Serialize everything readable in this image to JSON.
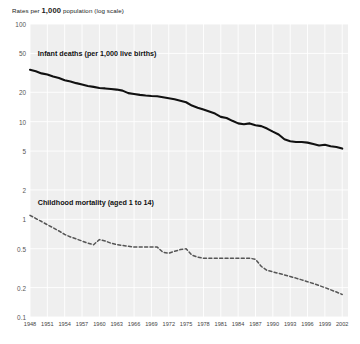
{
  "chart_data": {
    "type": "line",
    "title": "Rates per 1,000 population (log scale)",
    "title_plain": "Rates per 1,000 population (log scale)",
    "title_prefix": "Rates per ",
    "title_bold": "1,000",
    "title_suffix": " population (log scale)",
    "xlabel": "",
    "ylabel": "Rates per 1,000 population (log scale)",
    "yscale": "log",
    "ylim": [
      0.1,
      100
    ],
    "xlim": [
      1948,
      2003
    ],
    "grid": true,
    "legend_position": "inline-annotations",
    "ytick_labels": [
      "100",
      "50",
      "20",
      "10",
      "5",
      "2",
      "1",
      "0.5",
      "0.2",
      "0.1"
    ],
    "ytick_values": [
      100,
      50,
      20,
      10,
      5,
      2,
      1,
      0.5,
      0.2,
      0.1
    ],
    "xtick_labels": [
      "1948",
      "1951",
      "1954",
      "1957",
      "1960",
      "1963",
      "1966",
      "1969",
      "1972",
      "1975",
      "1978",
      "1981",
      "1984",
      "1987",
      "1990",
      "1993",
      "1996",
      "1999",
      "2002"
    ],
    "xtick_values": [
      1948,
      1951,
      1954,
      1957,
      1960,
      1963,
      1966,
      1969,
      1972,
      1975,
      1978,
      1981,
      1984,
      1987,
      1990,
      1993,
      1996,
      1999,
      2002
    ],
    "annotations": [
      {
        "name": "infant-deaths-label",
        "text": "Infant deaths (per 1,000 live births)",
        "x": 1949,
        "y": 50
      },
      {
        "name": "childhood-mortality-label",
        "text": "Childhood mortality (aged 1 to 14)",
        "x": 1949,
        "y": 1.5
      }
    ],
    "series": [
      {
        "name": "Infant deaths (per 1,000 live births)",
        "style": "solid",
        "color": "#111111",
        "x": [
          1948,
          1949,
          1950,
          1951,
          1952,
          1953,
          1954,
          1955,
          1956,
          1957,
          1958,
          1959,
          1960,
          1961,
          1962,
          1963,
          1964,
          1965,
          1966,
          1967,
          1968,
          1969,
          1970,
          1971,
          1972,
          1973,
          1974,
          1975,
          1976,
          1977,
          1978,
          1979,
          1980,
          1981,
          1982,
          1983,
          1984,
          1985,
          1986,
          1987,
          1988,
          1989,
          1990,
          1991,
          1992,
          1993,
          1994,
          1995,
          1996,
          1997,
          1998,
          1999,
          2000,
          2001,
          2002
        ],
        "values": [
          34.0,
          32.8,
          31.2,
          30.4,
          29.0,
          28.0,
          26.6,
          25.8,
          24.8,
          24.0,
          23.2,
          22.7,
          22.1,
          21.9,
          21.6,
          21.3,
          20.8,
          19.6,
          19.2,
          18.8,
          18.5,
          18.3,
          18.2,
          17.8,
          17.4,
          17.0,
          16.4,
          15.8,
          14.6,
          13.9,
          13.3,
          12.7,
          12.1,
          11.2,
          10.9,
          10.2,
          9.6,
          9.4,
          9.6,
          9.2,
          9.0,
          8.5,
          7.9,
          7.4,
          6.6,
          6.3,
          6.2,
          6.2,
          6.1,
          5.9,
          5.7,
          5.8,
          5.6,
          5.5,
          5.3
        ]
      },
      {
        "name": "Childhood mortality (aged 1 to 14)",
        "style": "dashed",
        "color": "#555555",
        "x": [
          1948,
          1949,
          1950,
          1951,
          1952,
          1953,
          1954,
          1955,
          1956,
          1957,
          1958,
          1959,
          1960,
          1961,
          1962,
          1963,
          1964,
          1965,
          1966,
          1967,
          1968,
          1969,
          1970,
          1971,
          1972,
          1973,
          1974,
          1975,
          1976,
          1977,
          1978,
          1979,
          1980,
          1981,
          1982,
          1983,
          1984,
          1985,
          1986,
          1987,
          1988,
          1989,
          1990,
          1991,
          1992,
          1993,
          1994,
          1995,
          1996,
          1997,
          1998,
          1999,
          2000,
          2001,
          2002
        ],
        "values": [
          1.1,
          1.02,
          0.95,
          0.88,
          0.82,
          0.76,
          0.7,
          0.66,
          0.63,
          0.6,
          0.57,
          0.55,
          0.62,
          0.6,
          0.57,
          0.55,
          0.54,
          0.53,
          0.52,
          0.52,
          0.52,
          0.52,
          0.52,
          0.46,
          0.45,
          0.47,
          0.49,
          0.5,
          0.43,
          0.41,
          0.4,
          0.4,
          0.4,
          0.4,
          0.4,
          0.4,
          0.4,
          0.4,
          0.4,
          0.39,
          0.33,
          0.3,
          0.29,
          0.28,
          0.27,
          0.26,
          0.25,
          0.24,
          0.23,
          0.22,
          0.21,
          0.2,
          0.19,
          0.18,
          0.17
        ]
      }
    ]
  },
  "logo": {
    "name": "ohe-logo",
    "text": "OHE",
    "subtitle": "OFFICE OF HEALTH ECONOMICS"
  }
}
